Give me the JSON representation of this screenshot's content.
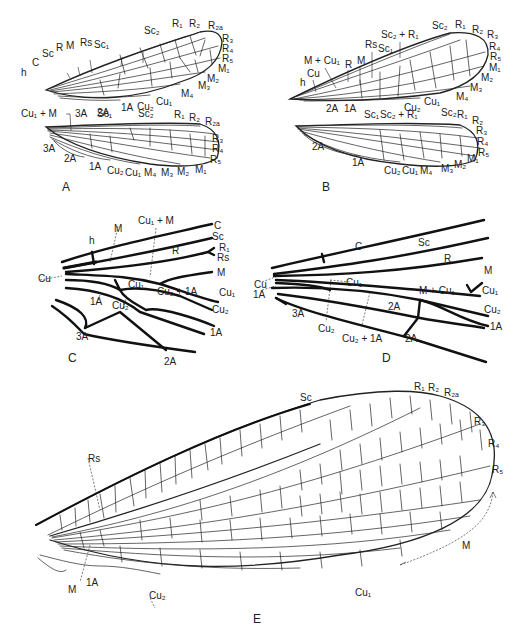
{
  "figure": {
    "panels": [
      {
        "id": "A",
        "label": "A",
        "forewing_labels": {
          "h": "h",
          "C": "C",
          "Sc": "Sc",
          "R": "R",
          "M": "M",
          "Rs": "Rs",
          "Sc1": "Sc₁",
          "Sc2": "Sc₂",
          "R1": "R₁",
          "R2": "R₂",
          "R2a": "R₂ₐ",
          "R3": "R₃",
          "R4": "R₄",
          "R5": "R₅",
          "M1": "M₁",
          "M2": "M₂",
          "M3": "M₃",
          "M4": "M₄",
          "Cu1": "Cu₁",
          "Cu2": "Cu₂",
          "A1": "1A",
          "A2": "2A"
        },
        "hindwing_labels": {
          "Cu1M": "Cu₁ + M",
          "A3top": "3A",
          "Sc1": "Sc₁",
          "Sc2": "Sc₂",
          "R1": "R₁",
          "R2": "R₂",
          "R2a": "R₂ₐ",
          "R3": "R₃",
          "R4": "R₄",
          "R5": "R₅",
          "A3": "3A",
          "A2": "2A",
          "A1": "1A",
          "Cu2": "Cu₂",
          "Cu1": "Cu₁",
          "M4": "M₄",
          "M3": "M₃",
          "M2": "M₂",
          "M1": "M₁"
        }
      },
      {
        "id": "B",
        "label": "B",
        "forewing_labels": {
          "h": "h",
          "Cu": "Cu",
          "MCu1": "M + Cu₁",
          "R": "R",
          "M": "M",
          "Rs": "Rs",
          "Sc1": "Sc₁",
          "Sc2R1": "Sc₂ + R₁",
          "Sc2": "Sc₂",
          "R1": "R₁",
          "R2": "R₂",
          "R3": "R₃",
          "R4": "R₄",
          "R5": "R₅",
          "M1": "M₁",
          "M2": "M₂",
          "M3": "M₃",
          "M4": "M₄",
          "Cu1": "Cu₁",
          "Cu2": "Cu₂",
          "A2": "2A",
          "A1": "1A"
        },
        "hindwing_labels": {
          "Sc1": "Sc₁",
          "Sc2R1": "Sc₂ + R₁",
          "Sc2": "Sc₂",
          "R1": "R₁",
          "R2": "R₂",
          "R3": "R₃",
          "R4": "R₄",
          "R5": "R₅",
          "M1": "M₁",
          "M2": "M₂",
          "M3": "M₃",
          "M4": "M₄",
          "Cu1": "Cu₁",
          "Cu2": "Cu₂",
          "A2": "2A",
          "A1": "1A"
        }
      },
      {
        "id": "C",
        "label": "C",
        "labels": {
          "h": "h",
          "M": "M",
          "Cu1M": "Cu₁ + M",
          "C": "C",
          "Sc": "Sc",
          "R1": "R₁",
          "Rs": "Rs",
          "R": "R",
          "Mr": "M",
          "Cu": "Cu",
          "Cu1in": "Cu₁",
          "Cu2A1": "Cu₂ + 1A",
          "Cu1r": "Cu₁",
          "A1in": "1A",
          "Cu2in": "Cu₂",
          "Cu2r": "Cu₂",
          "A1r": "1A",
          "A3": "3A",
          "A2": "2A"
        }
      },
      {
        "id": "D",
        "label": "D",
        "labels": {
          "C": "C",
          "Sc": "Sc",
          "R": "R",
          "M": "M",
          "Cu": "Cu",
          "Cu1in": "Cu₁",
          "MCu1": "M + Cu₁",
          "Cu1r": "Cu₁",
          "A1l": "1A",
          "A3": "3A",
          "A2in": "2A",
          "Cu2r": "Cu₂",
          "A1r": "1A",
          "Cu2b": "Cu₂",
          "Cu2A1": "Cu₂ + 1A",
          "A2b": "2A"
        }
      },
      {
        "id": "E",
        "label": "E",
        "labels": {
          "Sc": "Sc",
          "R1": "R₁",
          "R2": "R₂",
          "R2a": "R₂ₐ",
          "R3": "R₃",
          "R4": "R₄",
          "R5": "R₅",
          "Rs": "Rs",
          "M": "M",
          "Mb": "M",
          "A1": "1A",
          "Cu2": "Cu₂",
          "Cu1": "Cu₁"
        }
      }
    ]
  }
}
